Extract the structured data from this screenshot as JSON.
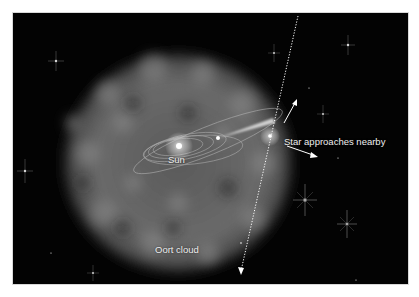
{
  "diagram": {
    "labels": {
      "sun": "Sun",
      "star": "Star approaches nearby",
      "oort": "Oort cloud"
    },
    "colors": {
      "background": "#030303",
      "cloud": "#6e6e6e",
      "text": "#eeeeee",
      "lines": "#ffffff"
    }
  }
}
